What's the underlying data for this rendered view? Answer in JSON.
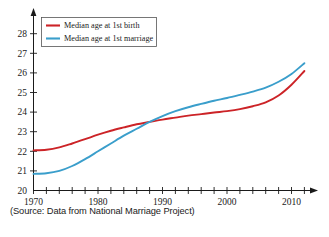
{
  "chart_data": {
    "type": "line",
    "title": "",
    "subtitle": "",
    "xlabel": "",
    "ylabel": "",
    "xlim": [
      1970,
      2012
    ],
    "ylim": [
      20,
      28.6
    ],
    "yticks": [
      20,
      21,
      22,
      23,
      24,
      25,
      26,
      27,
      28
    ],
    "ytick_labels": [
      "20",
      "21",
      "22",
      "23",
      "24",
      "25",
      "26",
      "27",
      "28"
    ],
    "xticks_major": [
      1970,
      1980,
      1990,
      2000,
      2010
    ],
    "xtick_labels": [
      "1970",
      "1980",
      "1990",
      "2000",
      "2010"
    ],
    "xticks_minor_step": 2,
    "grid": false,
    "legend_position": "top-left",
    "series": [
      {
        "name": "Median age at 1st birth",
        "color": "#cc2327",
        "x": [
          1970,
          1972,
          1974,
          1976,
          1978,
          1980,
          1982,
          1984,
          1986,
          1988,
          1990,
          1992,
          1994,
          1996,
          1998,
          2000,
          2002,
          2004,
          2006,
          2008,
          2010,
          2012
        ],
        "values": [
          22.05,
          22.08,
          22.2,
          22.4,
          22.62,
          22.85,
          23.05,
          23.22,
          23.38,
          23.5,
          23.62,
          23.72,
          23.82,
          23.9,
          23.98,
          24.05,
          24.15,
          24.3,
          24.5,
          24.85,
          25.4,
          26.1
        ]
      },
      {
        "name": "Median age at 1st marriage",
        "color": "#3a9ecb",
        "x": [
          1970,
          1972,
          1974,
          1976,
          1978,
          1980,
          1982,
          1984,
          1986,
          1988,
          1990,
          1992,
          1994,
          1996,
          1998,
          2000,
          2002,
          2004,
          2006,
          2008,
          2010,
          2012
        ],
        "values": [
          20.85,
          20.88,
          21.0,
          21.25,
          21.6,
          22.0,
          22.4,
          22.8,
          23.15,
          23.5,
          23.8,
          24.05,
          24.25,
          24.42,
          24.58,
          24.72,
          24.88,
          25.05,
          25.25,
          25.55,
          25.95,
          26.5
        ]
      }
    ],
    "annotations": [
      {
        "name": "source-note",
        "text": "(Source: Data from National Marriage Project)"
      }
    ]
  },
  "legend": {
    "entries": [
      {
        "label": "Median age at 1st birth",
        "color": "#cc2327"
      },
      {
        "label": "Median age at 1st marriage",
        "color": "#3a9ecb"
      }
    ]
  },
  "axes": {
    "y_labels": [
      "28",
      "27",
      "26",
      "25",
      "24",
      "23",
      "22",
      "21",
      "20"
    ],
    "x_labels": [
      "1970",
      "1980",
      "1990",
      "2000",
      "2010"
    ]
  },
  "source": {
    "text": "(Source: Data from National Marriage Project)"
  }
}
